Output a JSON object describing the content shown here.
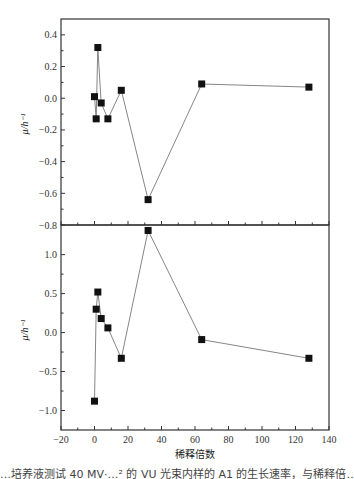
{
  "chart_data": [
    {
      "type": "line",
      "panel": "top",
      "title": "",
      "xlabel": "",
      "ylabel": "μ/h⁻¹",
      "xlim": [
        -20,
        140
      ],
      "ylim": [
        -0.8,
        0.5
      ],
      "yticks": [
        0.4,
        0.2,
        0.0,
        -0.2,
        -0.4,
        -0.6,
        -0.8
      ],
      "ytick_labels": [
        "0.4",
        "0.2",
        "0.0",
        "−0.2",
        "−0.4",
        "−0.6",
        "−0.8"
      ],
      "grid": false,
      "marker": "square",
      "series": [
        {
          "name": "top",
          "x": [
            0,
            1,
            2,
            4,
            8,
            16,
            32,
            64,
            128
          ],
          "y": [
            0.01,
            -0.13,
            0.32,
            -0.03,
            -0.13,
            0.05,
            -0.64,
            0.09,
            0.07
          ]
        }
      ]
    },
    {
      "type": "line",
      "panel": "bottom",
      "title": "",
      "xlabel": "稀释倍数",
      "ylabel": "μ/h⁻¹",
      "xlim": [
        -20,
        140
      ],
      "ylim": [
        -1.25,
        1.38
      ],
      "xticks": [
        -20,
        0,
        20,
        40,
        60,
        80,
        100,
        120,
        140
      ],
      "xtick_labels": [
        "−20",
        "0",
        "20",
        "40",
        "60",
        "80",
        "100",
        "120",
        "140"
      ],
      "yticks": [
        1.0,
        0.5,
        0.0,
        -0.5,
        -1.0
      ],
      "ytick_labels": [
        "1.0",
        "0.5",
        "0.0",
        "−0.5",
        "−1.0"
      ],
      "grid": false,
      "marker": "square",
      "series": [
        {
          "name": "bottom",
          "x": [
            0,
            1,
            2,
            4,
            8,
            16,
            32,
            64,
            128
          ],
          "y": [
            -0.88,
            0.3,
            0.52,
            0.18,
            0.06,
            -0.33,
            1.31,
            -0.09,
            -0.33
          ]
        }
      ]
    }
  ],
  "labels": {
    "xlabel": "稀释倍数",
    "ylabel_top": "μ/h⁻¹",
    "ylabel_bottom": "μ/h⁻¹",
    "caption_partial": "…培养液测试 40 MV·…² 的 VU 光束内样的 A1 的生长速率，与稀释倍…"
  },
  "colors": {
    "frame": "#333333",
    "line": "#777777",
    "marker": "#111111"
  }
}
